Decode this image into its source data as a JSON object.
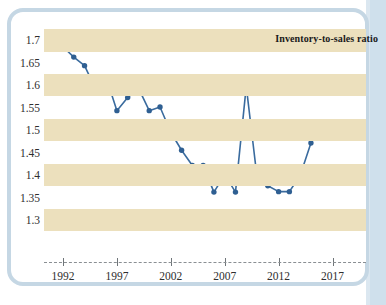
{
  "chart_data": {
    "type": "line",
    "title": "Inventory-to-sales ratio",
    "xlabel": "",
    "ylabel": "",
    "xlim": [
      1991,
      2018
    ],
    "ylim": [
      1.28,
      1.72
    ],
    "grid": "horizontal-bands",
    "legend": "none",
    "line_color": "#3a6b9e",
    "marker_color": "#2f5f92",
    "band_color": "#ece0bd",
    "series_name": "Inventory-to-sales ratio",
    "y_ticks": [
      "1.7",
      "1.65",
      "1.6",
      "1.55",
      "1.5",
      "1.45",
      "1.4",
      "1.35",
      "1.3"
    ],
    "y_tick_values": [
      1.7,
      1.65,
      1.6,
      1.55,
      1.5,
      1.45,
      1.4,
      1.35,
      1.3
    ],
    "x_ticks": [
      "1992",
      "1997",
      "2002",
      "2007",
      "2012",
      "2017"
    ],
    "x_tick_values": [
      1992,
      1997,
      2002,
      2007,
      2012,
      2017
    ],
    "x": [
      1992,
      1993,
      1994,
      1995,
      1996,
      1997,
      1998,
      1999,
      2000,
      2001,
      2002,
      2003,
      2004,
      2005,
      2006,
      2007,
      2008,
      2009,
      2010,
      2011,
      2012,
      2013,
      2014,
      2015
    ],
    "values": [
      1.685,
      1.662,
      1.643,
      1.592,
      1.617,
      1.543,
      1.572,
      1.593,
      1.543,
      1.551,
      1.495,
      1.455,
      1.421,
      1.421,
      1.362,
      1.401,
      1.362,
      1.597,
      1.395,
      1.376,
      1.363,
      1.363,
      1.399,
      1.471
    ]
  },
  "frame": {
    "border_color": "#c5d7e4"
  },
  "page": {
    "strip_color": "#cfe0ec"
  }
}
